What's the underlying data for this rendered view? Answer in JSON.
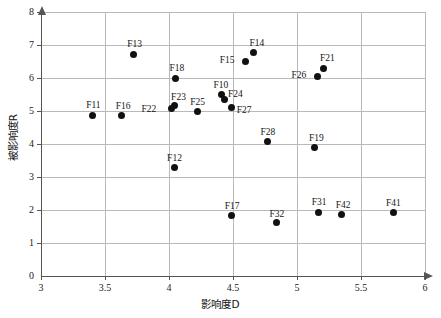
{
  "chart_data": {
    "type": "scatter",
    "title": "",
    "xlabel": "影响度D",
    "ylabel": "被影响度R",
    "xlim": [
      3,
      6
    ],
    "ylim": [
      0,
      8
    ],
    "xticks": [
      "3",
      "3.5",
      "4",
      "4.5",
      "5",
      "5.5",
      "6"
    ],
    "xtick_values": [
      3,
      3.5,
      4,
      4.5,
      5,
      5.5,
      6
    ],
    "yticks": [
      "0",
      "1",
      "2",
      "3",
      "4",
      "5",
      "6",
      "7",
      "8"
    ],
    "ytick_values": [
      0,
      1,
      2,
      3,
      4,
      5,
      6,
      7,
      8
    ],
    "grid": true,
    "legend": "none",
    "marker_color": "#111111",
    "grid_color": "#b9b9b9",
    "axis_color": "#555555",
    "points": [
      {
        "label": "F11",
        "x": 3.4,
        "y": 4.87,
        "lx": -6,
        "ly": -15
      },
      {
        "label": "F16",
        "x": 3.63,
        "y": 4.86,
        "lx": -6,
        "ly": -15
      },
      {
        "label": "F13",
        "x": 3.72,
        "y": 6.72,
        "lx": -6,
        "ly": -15
      },
      {
        "label": "F18",
        "x": 4.05,
        "y": 5.99,
        "lx": -6,
        "ly": -15
      },
      {
        "label": "F22",
        "x": 4.02,
        "y": 5.07,
        "lx": -30,
        "ly": -5
      },
      {
        "label": "F23",
        "x": 4.04,
        "y": 5.16,
        "lx": -3,
        "ly": -14
      },
      {
        "label": "F12",
        "x": 4.04,
        "y": 3.28,
        "lx": -7,
        "ly": -15
      },
      {
        "label": "F25",
        "x": 4.22,
        "y": 4.97,
        "lx": -7,
        "ly": -15
      },
      {
        "label": "F10",
        "x": 4.41,
        "y": 5.5,
        "lx": -8,
        "ly": -15
      },
      {
        "label": "F24",
        "x": 4.43,
        "y": 5.34,
        "lx": 4,
        "ly": -11
      },
      {
        "label": "F27",
        "x": 4.49,
        "y": 5.11,
        "lx": 5,
        "ly": -2
      },
      {
        "label": "F15",
        "x": 4.6,
        "y": 6.49,
        "lx": -26,
        "ly": -7
      },
      {
        "label": "F14",
        "x": 4.66,
        "y": 6.76,
        "lx": -4,
        "ly": -15
      },
      {
        "label": "F17",
        "x": 4.49,
        "y": 1.82,
        "lx": -7,
        "ly": -15
      },
      {
        "label": "F32",
        "x": 4.84,
        "y": 1.61,
        "lx": -7,
        "ly": -14
      },
      {
        "label": "F28",
        "x": 4.77,
        "y": 4.07,
        "lx": -7,
        "ly": -15
      },
      {
        "label": "F19",
        "x": 5.14,
        "y": 3.9,
        "lx": -6,
        "ly": -14
      },
      {
        "label": "F26",
        "x": 5.16,
        "y": 6.05,
        "lx": -26,
        "ly": -6
      },
      {
        "label": "F21",
        "x": 5.21,
        "y": 6.3,
        "lx": -4,
        "ly": -15
      },
      {
        "label": "F31",
        "x": 5.17,
        "y": 1.93,
        "lx": -7,
        "ly": -15
      },
      {
        "label": "F42",
        "x": 5.35,
        "y": 1.85,
        "lx": -6,
        "ly": -15
      },
      {
        "label": "F41",
        "x": 5.75,
        "y": 1.91,
        "lx": -7,
        "ly": -15
      }
    ]
  }
}
